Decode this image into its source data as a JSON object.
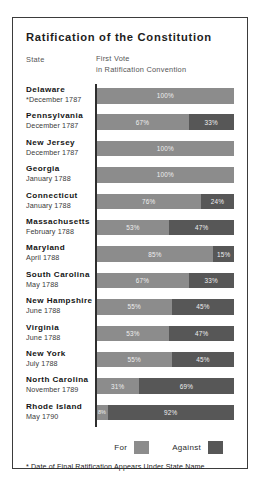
{
  "title": "Ratification of the Constitution",
  "headers": {
    "state": "State",
    "vote_line1": "First Vote",
    "vote_line2": "in Ratification Convention"
  },
  "legend": {
    "for_label": "For",
    "against_label": "Against",
    "for_color": "#8c8c8c",
    "against_color": "#575757"
  },
  "footnote": "* Date of Final Ratification Appears Under State Name",
  "rows": [
    {
      "state": "Delaware",
      "date": "*December 1787",
      "for_label": "100%",
      "against_label": ""
    },
    {
      "state": "Pennsylvania",
      "date": "December 1787",
      "for_label": "67%",
      "against_label": "33%"
    },
    {
      "state": "New Jersey",
      "date": "December 1787",
      "for_label": "100%",
      "against_label": ""
    },
    {
      "state": "Georgia",
      "date": "January 1788",
      "for_label": "100%",
      "against_label": ""
    },
    {
      "state": "Connecticut",
      "date": "January 1788",
      "for_label": "76%",
      "against_label": "24%"
    },
    {
      "state": "Massachusetts",
      "date": "February 1788",
      "for_label": "53%",
      "against_label": "47%"
    },
    {
      "state": "Maryland",
      "date": "April 1788",
      "for_label": "85%",
      "against_label": "15%"
    },
    {
      "state": "South Carolina",
      "date": "May 1788",
      "for_label": "67%",
      "against_label": "33%"
    },
    {
      "state": "New Hampshire",
      "date": "June 1788",
      "for_label": "55%",
      "against_label": "45%"
    },
    {
      "state": "Virginia",
      "date": "June 1788",
      "for_label": "53%",
      "against_label": "47%"
    },
    {
      "state": "New York",
      "date": "July 1788",
      "for_label": "55%",
      "against_label": "45%"
    },
    {
      "state": "North Carolina",
      "date": "November 1789",
      "for_label": "31%",
      "against_label": "69%"
    },
    {
      "state": "Rhode Island",
      "date": "May 1790",
      "for_label": "8%",
      "against_label": "92%"
    }
  ],
  "chart_data": {
    "type": "bar",
    "title": "Ratification of the Constitution",
    "subtitle": "First Vote in Ratification Convention",
    "xlabel": "",
    "ylabel": "State",
    "xlim": [
      0,
      100
    ],
    "grid": false,
    "legend_position": "bottom-right",
    "orientation": "horizontal",
    "stacked": true,
    "categories": [
      "Delaware",
      "Pennsylvania",
      "New Jersey",
      "Georgia",
      "Connecticut",
      "Massachusetts",
      "Maryland",
      "South Carolina",
      "New Hampshire",
      "Virginia",
      "New York",
      "North Carolina",
      "Rhode Island"
    ],
    "series": [
      {
        "name": "For",
        "values": [
          100,
          67,
          100,
          100,
          76,
          53,
          85,
          67,
          55,
          53,
          55,
          31,
          8
        ]
      },
      {
        "name": "Against",
        "values": [
          0,
          33,
          0,
          0,
          24,
          47,
          15,
          33,
          45,
          47,
          45,
          69,
          92
        ]
      }
    ],
    "annotations": [
      "* Date of Final Ratification Appears Under State Name"
    ]
  }
}
